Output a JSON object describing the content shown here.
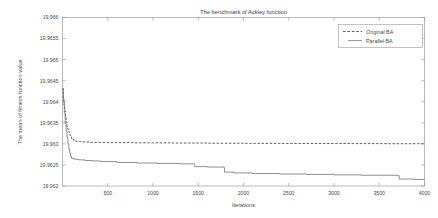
{
  "chart_data": {
    "type": "line",
    "title": "The benchmark of Ackley function",
    "xlabel": "Iterations",
    "ylabel": "The mean of fitness function value",
    "xlim": [
      0,
      4000
    ],
    "ylim": [
      19.962,
      19.966
    ],
    "grid": false,
    "legend_position": "top-right",
    "xticks": [
      500,
      1000,
      1500,
      2000,
      2500,
      3000,
      3500,
      4000
    ],
    "xtick_labels": [
      "500",
      "1000",
      "1500",
      "2000",
      "2500",
      "3000",
      "3500",
      "4000"
    ],
    "yticks": [
      19.962,
      19.9625,
      19.963,
      19.9635,
      19.964,
      19.9645,
      19.965,
      19.9655,
      19.966
    ],
    "ytick_labels": [
      "19.962",
      "19.9625",
      "19.963",
      "19.9635",
      "19.964",
      "19.9645",
      "19.965",
      "19.9655",
      "19.966"
    ],
    "series": [
      {
        "name": "Original BA",
        "style": "dashed",
        "color": "#4d4d4d",
        "x": [
          0,
          8,
          16,
          24,
          32,
          40,
          50,
          60,
          70,
          80,
          90,
          100,
          120,
          150,
          200,
          300,
          500,
          800,
          1200,
          1600,
          2000,
          2400,
          2800,
          3200,
          3600,
          4000
        ],
        "y": [
          19.96432,
          19.9641,
          19.96392,
          19.96378,
          19.96364,
          19.96352,
          19.96341,
          19.96334,
          19.96328,
          19.96322,
          19.96317,
          19.96313,
          19.963085,
          19.96306,
          19.963045,
          19.963035,
          19.96303,
          19.963025,
          19.96302,
          19.963015,
          19.963012,
          19.96301,
          19.963008,
          19.963006,
          19.963004,
          19.963002
        ]
      },
      {
        "name": "Parallel BA",
        "style": "solid",
        "color": "#6b6b6b",
        "x": [
          0,
          10,
          20,
          30,
          40,
          50,
          60,
          70,
          80,
          90,
          100,
          130,
          180,
          250,
          330,
          420,
          600,
          820,
          1050,
          1300,
          1450,
          1460,
          1600,
          1780,
          1790,
          1900,
          2100,
          2400,
          2700,
          3000,
          3300,
          3700,
          3720,
          3900,
          4000
        ],
        "y": [
          19.9643,
          19.964,
          19.96372,
          19.96348,
          19.9633,
          19.96315,
          19.963,
          19.96288,
          19.96278,
          19.9627,
          19.962655,
          19.962635,
          19.96262,
          19.962605,
          19.962595,
          19.96258,
          19.96256,
          19.962545,
          19.962535,
          19.962525,
          19.96252,
          19.96246,
          19.96245,
          19.96244,
          19.96233,
          19.96231,
          19.962295,
          19.962285,
          19.962275,
          19.962265,
          19.962255,
          19.962245,
          19.962165,
          19.962155,
          19.96215
        ]
      }
    ]
  },
  "legend": {
    "items": [
      {
        "label": "Original BA"
      },
      {
        "label": "Parallel BA"
      }
    ]
  }
}
